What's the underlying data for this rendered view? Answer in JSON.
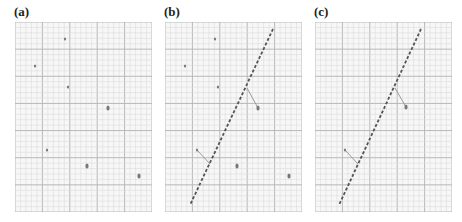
{
  "figure": {
    "panels": [
      {
        "label": "(a)",
        "left": 15,
        "line": null,
        "points": [
          {
            "x": 50,
            "y": 17,
            "size": "small"
          },
          {
            "x": 20,
            "y": 44,
            "size": "small"
          },
          {
            "x": 53,
            "y": 65,
            "size": "small"
          },
          {
            "x": 93,
            "y": 86,
            "size": "large"
          },
          {
            "x": 32,
            "y": 128,
            "size": "small"
          },
          {
            "x": 72,
            "y": 144,
            "size": "large"
          },
          {
            "x": 124,
            "y": 154,
            "size": "large"
          }
        ],
        "connectors": []
      },
      {
        "label": "(b)",
        "left": 165,
        "line": {
          "x1": 108,
          "y1": 7,
          "x2": 25,
          "y2": 183
        },
        "points": [
          {
            "x": 50,
            "y": 17,
            "size": "small"
          },
          {
            "x": 20,
            "y": 44,
            "size": "small"
          },
          {
            "x": 53,
            "y": 65,
            "size": "small"
          },
          {
            "x": 93,
            "y": 86,
            "size": "large"
          },
          {
            "x": 32,
            "y": 128,
            "size": "small"
          },
          {
            "x": 72,
            "y": 144,
            "size": "large"
          },
          {
            "x": 124,
            "y": 154,
            "size": "large"
          }
        ],
        "connectors": [
          {
            "from": 3,
            "to": {
              "x": 82,
              "y": 66
            }
          },
          {
            "from": 4,
            "to": {
              "x": 45,
              "y": 142
            }
          }
        ]
      },
      {
        "label": "(c)",
        "left": 315,
        "line": {
          "x1": 106,
          "y1": 7,
          "x2": 24,
          "y2": 183
        },
        "points": [
          {
            "x": 91,
            "y": 85,
            "size": "large"
          },
          {
            "x": 30,
            "y": 128,
            "size": "small"
          }
        ],
        "connectors": [
          {
            "from": 0,
            "to": {
              "x": 80,
              "y": 66
            }
          },
          {
            "from": 1,
            "to": {
              "x": 43,
              "y": 142
            }
          }
        ]
      }
    ],
    "grid": {
      "width": 137,
      "height": 190,
      "major_cols": 5,
      "major_rows": 7,
      "minor_per_major": 5,
      "major_color": "#b8b8b8",
      "minor_color": "#dcdcdc",
      "background": "#f7f7f7"
    },
    "colors": {
      "point": "#777777",
      "line": "#555555",
      "connector": "#9a9a9a"
    }
  }
}
